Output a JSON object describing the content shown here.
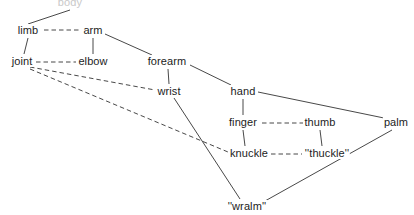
{
  "diagram": {
    "background": "#ffffff",
    "line_color": "#333333",
    "text_color": "#1c1c1c",
    "width": 414,
    "height": 215,
    "nodes": [
      {
        "id": "body",
        "label": "body",
        "x": 70,
        "y": 2,
        "clipped": true
      },
      {
        "id": "limb",
        "label": "limb",
        "x": 28,
        "y": 30,
        "clipped": false
      },
      {
        "id": "arm",
        "label": "arm",
        "x": 93,
        "y": 30,
        "clipped": false
      },
      {
        "id": "joint",
        "label": "joint",
        "x": 22,
        "y": 61,
        "clipped": false
      },
      {
        "id": "elbow",
        "label": "elbow",
        "x": 93,
        "y": 61,
        "clipped": false
      },
      {
        "id": "forearm",
        "label": "forearm",
        "x": 167,
        "y": 61,
        "clipped": false
      },
      {
        "id": "wrist",
        "label": "wrist",
        "x": 169,
        "y": 91,
        "clipped": false
      },
      {
        "id": "hand",
        "label": "hand",
        "x": 243,
        "y": 91,
        "clipped": false
      },
      {
        "id": "finger",
        "label": "finger",
        "x": 243,
        "y": 122,
        "clipped": false
      },
      {
        "id": "thumb",
        "label": "thumb",
        "x": 320,
        "y": 122,
        "clipped": false
      },
      {
        "id": "palm",
        "label": "palm",
        "x": 396,
        "y": 122,
        "clipped": false
      },
      {
        "id": "knuckle",
        "label": "knuckle",
        "x": 249,
        "y": 153,
        "clipped": false
      },
      {
        "id": "thuckle",
        "label": "''thuckle''",
        "x": 327,
        "y": 153,
        "clipped": false
      },
      {
        "id": "wralm",
        "label": "''wralm''",
        "x": 247,
        "y": 206,
        "clipped": false
      }
    ],
    "edges": [
      {
        "from": "body",
        "to": "limb",
        "style": "solid",
        "x1": 70,
        "y1": 10,
        "x2": 28,
        "y2": 24
      },
      {
        "from": "limb",
        "to": "arm",
        "style": "dashed",
        "x1": 44,
        "y1": 30,
        "x2": 80,
        "y2": 30
      },
      {
        "from": "limb",
        "to": "joint",
        "style": "solid",
        "x1": 28,
        "y1": 38,
        "x2": 24,
        "y2": 54
      },
      {
        "from": "arm",
        "to": "elbow",
        "style": "solid",
        "x1": 93,
        "y1": 38,
        "x2": 93,
        "y2": 54
      },
      {
        "from": "arm",
        "to": "forearm",
        "style": "solid",
        "x1": 105,
        "y1": 34,
        "x2": 152,
        "y2": 55
      },
      {
        "from": "joint",
        "to": "elbow",
        "style": "dashed",
        "x1": 36,
        "y1": 62,
        "x2": 76,
        "y2": 62
      },
      {
        "from": "joint",
        "to": "wrist",
        "style": "dashed",
        "x1": 30,
        "y1": 67,
        "x2": 155,
        "y2": 90
      },
      {
        "from": "joint",
        "to": "knuckle",
        "style": "dashed",
        "x1": 30,
        "y1": 69,
        "x2": 228,
        "y2": 152
      },
      {
        "from": "forearm",
        "to": "wrist",
        "style": "solid",
        "x1": 168,
        "y1": 69,
        "x2": 169,
        "y2": 84
      },
      {
        "from": "forearm",
        "to": "hand",
        "style": "solid",
        "x1": 190,
        "y1": 65,
        "x2": 231,
        "y2": 85
      },
      {
        "from": "wrist",
        "to": "wralm",
        "style": "solid",
        "x1": 174,
        "y1": 98,
        "x2": 240,
        "y2": 199
      },
      {
        "from": "hand",
        "to": "finger",
        "style": "solid",
        "x1": 243,
        "y1": 99,
        "x2": 243,
        "y2": 115
      },
      {
        "from": "hand",
        "to": "palm",
        "style": "solid",
        "x1": 258,
        "y1": 92,
        "x2": 384,
        "y2": 118
      },
      {
        "from": "finger",
        "to": "thumb",
        "style": "dashed",
        "x1": 262,
        "y1": 123,
        "x2": 303,
        "y2": 123
      },
      {
        "from": "finger",
        "to": "knuckle",
        "style": "solid",
        "x1": 243,
        "y1": 130,
        "x2": 245,
        "y2": 146
      },
      {
        "from": "thumb",
        "to": "thuckle",
        "style": "solid",
        "x1": 320,
        "y1": 130,
        "x2": 322,
        "y2": 146
      },
      {
        "from": "knuckle",
        "to": "thuckle",
        "style": "dashed",
        "x1": 271,
        "y1": 154,
        "x2": 302,
        "y2": 154
      },
      {
        "from": "palm",
        "to": "wralm",
        "style": "solid",
        "x1": 392,
        "y1": 130,
        "x2": 265,
        "y2": 201
      }
    ]
  }
}
